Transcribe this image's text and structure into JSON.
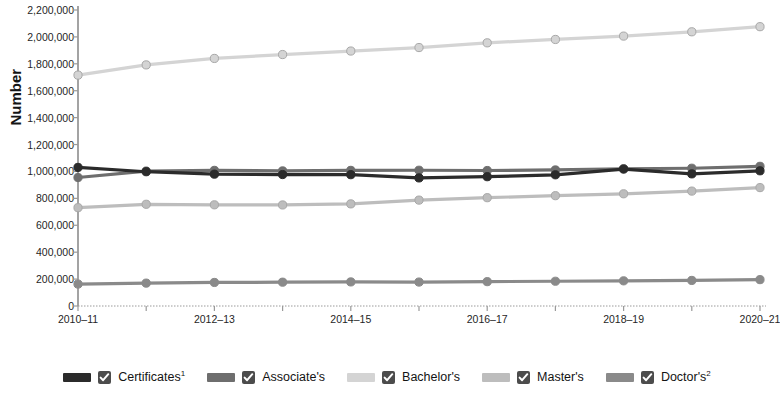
{
  "chart_data": {
    "type": "line",
    "title": "",
    "xlabel": "",
    "ylabel": "Number",
    "categories": [
      "2010–11",
      "2011–12",
      "2012–13",
      "2013–14",
      "2014–15",
      "2015–16",
      "2016–17",
      "2017–18",
      "2018–19",
      "2019–20",
      "2020–21"
    ],
    "xtick_labels_shown": [
      "2010–11",
      "2012–13",
      "2014–15",
      "2016–17",
      "2018–19",
      "2020–21"
    ],
    "ytick_labels": [
      "0",
      "200,000",
      "400,000",
      "600,000",
      "800,000",
      "1,000,000",
      "1,200,000",
      "1,400,000",
      "1,600,000",
      "1,800,000",
      "2,000,000",
      "2,200,000"
    ],
    "ytick_values": [
      0,
      200000,
      400000,
      600000,
      800000,
      1000000,
      1200000,
      1400000,
      1600000,
      1800000,
      2000000,
      2200000
    ],
    "ylim": [
      0,
      2200000
    ],
    "grid": false,
    "legend_position": "bottom",
    "series": [
      {
        "name": "Certificates",
        "footnote": "1",
        "color": "#2b2b2b",
        "values": [
          1030000,
          998000,
          980000,
          977000,
          976000,
          952000,
          961000,
          975000,
          1018000,
          982000,
          1005000
        ]
      },
      {
        "name": "Associate's",
        "footnote": "",
        "color": "#6e6e6e",
        "values": [
          955000,
          1003000,
          1008000,
          1004000,
          1008000,
          1009000,
          1007000,
          1011000,
          1020000,
          1024000,
          1038000
        ]
      },
      {
        "name": "Bachelor's",
        "footnote": "",
        "color": "#d4d4d4",
        "values": [
          1716000,
          1792000,
          1840000,
          1869000,
          1895000,
          1921000,
          1956000,
          1981000,
          2006000,
          2038000,
          2076000
        ]
      },
      {
        "name": "Master's",
        "footnote": "",
        "color": "#bdbdbd",
        "values": [
          731000,
          756000,
          752000,
          751000,
          759000,
          787000,
          805000,
          820000,
          834000,
          854000,
          880000
        ]
      },
      {
        "name": "Doctor's",
        "footnote": "2",
        "color": "#8a8a8a",
        "values": [
          163000,
          170000,
          175000,
          177000,
          179000,
          178000,
          181000,
          184000,
          187000,
          190000,
          196000
        ]
      }
    ]
  },
  "legend": {
    "items": [
      {
        "label": "Certificates",
        "footnote": "1",
        "checkbox": "checked-checkbox-icon"
      },
      {
        "label": "Associate's",
        "footnote": "",
        "checkbox": "checked-checkbox-icon"
      },
      {
        "label": "Bachelor's",
        "footnote": "",
        "checkbox": "checked-checkbox-icon"
      },
      {
        "label": "Master's",
        "footnote": "",
        "checkbox": "checked-checkbox-icon"
      },
      {
        "label": "Doctor's",
        "footnote": "2",
        "checkbox": "checked-checkbox-icon"
      }
    ]
  },
  "axis_colors": {
    "axis_line": "#8c8c8c",
    "tick": "#9a9a9a",
    "text": "#1f1f1f"
  }
}
